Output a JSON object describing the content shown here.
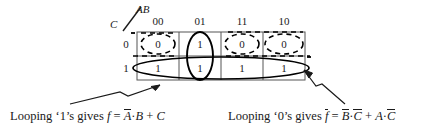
{
  "figure": {
    "type": "karnaugh-map",
    "axis": {
      "row_variable": "C",
      "column_variables": "AB"
    },
    "column_headers": [
      "00",
      "01",
      "11",
      "10"
    ],
    "row_headers": [
      "0",
      "1"
    ],
    "cells": [
      [
        "0",
        "1",
        "0",
        "0"
      ],
      [
        "1",
        "1",
        "1",
        "1"
      ]
    ]
  },
  "captions": {
    "left": {
      "lead": "Looping ‘1’s gives",
      "func": "f",
      "equals": "=",
      "term1_bar": "A",
      "dot1": "·",
      "term2": "B",
      "plus": "+",
      "term3": "C"
    },
    "right": {
      "lead": "Looping ‘0’s gives",
      "func_bar": "f",
      "equals": "=",
      "term1_bar": "B",
      "dot1": "·",
      "term2_bar": "C",
      "plus": "+",
      "term3": "A",
      "dot2": "·",
      "term4_bar": "C"
    }
  },
  "colors": {
    "ink": "#1a1a1a",
    "grid": "#4a4a4a"
  }
}
